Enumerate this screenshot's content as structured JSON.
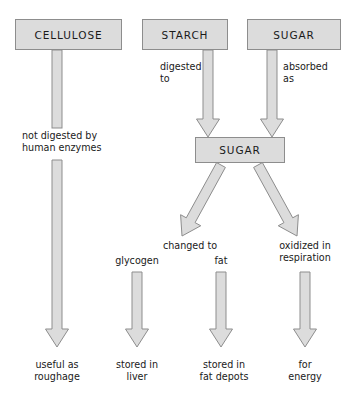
{
  "diagram": {
    "colors": {
      "box_fill": "#dcdcdc",
      "box_stroke": "#8d8d8d",
      "arrow_fill": "#dcdcdc",
      "arrow_stroke": "#8d8d8d",
      "text": "#1a1a1a",
      "background": "#ffffff"
    },
    "nodes": [
      {
        "id": "cellulose",
        "label": "CELLULOSE",
        "x": 15,
        "y": 19,
        "w": 107,
        "h": 31
      },
      {
        "id": "starch",
        "label": "STARCH",
        "x": 142,
        "y": 19,
        "w": 86,
        "h": 31
      },
      {
        "id": "sugar_top",
        "label": "SUGAR",
        "x": 247,
        "y": 19,
        "w": 94,
        "h": 31
      },
      {
        "id": "sugar_mid",
        "label": "SUGAR",
        "x": 195,
        "y": 137,
        "w": 90,
        "h": 26
      }
    ],
    "edge_labels": [
      {
        "id": "digested-to",
        "text": "digested\nto",
        "x": 160,
        "y": 61,
        "align": "left"
      },
      {
        "id": "absorbed-as",
        "text": "absorbed\nas",
        "x": 283,
        "y": 61,
        "align": "left"
      },
      {
        "id": "not-digested",
        "text": "not digested by\nhuman enzymes",
        "x": 22,
        "y": 130,
        "align": "left"
      },
      {
        "id": "changed-to",
        "text": "changed to",
        "x": 190,
        "y": 240,
        "align": "center"
      },
      {
        "id": "oxidized-in-respiration",
        "text": "oxidized in\nrespiration",
        "x": 305,
        "y": 240,
        "align": "center"
      },
      {
        "id": "glycogen",
        "text": "glycogen",
        "x": 137,
        "y": 255,
        "align": "center"
      },
      {
        "id": "fat",
        "text": "fat",
        "x": 221,
        "y": 255,
        "align": "center"
      }
    ],
    "terminal_labels": [
      {
        "id": "useful-as-roughage",
        "text": "useful as\nroughage",
        "x": 57,
        "y": 359
      },
      {
        "id": "stored-in-liver",
        "text": "stored in\nliver",
        "x": 137,
        "y": 359
      },
      {
        "id": "stored-in-fat-depots",
        "text": "stored in\nfat depots",
        "x": 224,
        "y": 359
      },
      {
        "id": "for-energy",
        "text": "for\nenergy",
        "x": 305,
        "y": 359
      }
    ],
    "arrows": [
      {
        "id": "cellulose-upper-shaft",
        "type": "shaft",
        "x": 52,
        "y1": 50,
        "y2": 128,
        "w": 10
      },
      {
        "id": "cellulose-lower-arrow",
        "type": "vertical",
        "x": 52,
        "y1": 160,
        "tip": 347,
        "w": 10,
        "head_w": 23,
        "head_h": 18
      },
      {
        "id": "starch-to-sugar",
        "type": "vertical",
        "x": 203,
        "y1": 50,
        "tip": 137,
        "w": 10,
        "head_w": 23,
        "head_h": 18
      },
      {
        "id": "sugar-top-to-sugar",
        "type": "vertical",
        "x": 267,
        "y1": 50,
        "tip": 137,
        "w": 10,
        "head_w": 23,
        "head_h": 18
      },
      {
        "id": "sugar-to-changed-to",
        "type": "diagonal",
        "x1": 221,
        "y1": 165,
        "x2": 182,
        "y2": 236,
        "w": 10,
        "head_w": 23,
        "head_h": 18
      },
      {
        "id": "sugar-to-oxidized",
        "type": "diagonal",
        "x1": 258,
        "y1": 165,
        "x2": 297,
        "y2": 236,
        "w": 10,
        "head_w": 23,
        "head_h": 18
      },
      {
        "id": "glycogen-arrow",
        "type": "vertical",
        "x": 132,
        "y1": 272,
        "tip": 347,
        "w": 10,
        "head_w": 23,
        "head_h": 18
      },
      {
        "id": "fat-arrow",
        "type": "vertical",
        "x": 216,
        "y1": 272,
        "tip": 347,
        "w": 10,
        "head_w": 23,
        "head_h": 18
      },
      {
        "id": "energy-arrow",
        "type": "vertical",
        "x": 300,
        "y1": 272,
        "tip": 347,
        "w": 10,
        "head_w": 23,
        "head_h": 18
      }
    ]
  }
}
